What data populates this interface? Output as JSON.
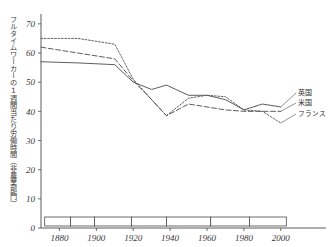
{
  "chart_data": {
    "type": "line",
    "title": "",
    "xlabel": "",
    "ylabel": "フルタイムワーカーの1週間当たり労働時間（非農業部門）",
    "xlim": [
      1870,
      2005
    ],
    "ylim": [
      0,
      72
    ],
    "grid": false,
    "legend_position": "right-inline",
    "xticks": [
      1880,
      1900,
      1920,
      1940,
      1960,
      1980,
      2000
    ],
    "xtick_labels": [
      "1880",
      "1900",
      "1920",
      "1940",
      "1960",
      "1980",
      "2000"
    ],
    "yticks": [
      0,
      10,
      20,
      30,
      40,
      50,
      60,
      70
    ],
    "ytick_labels": [
      "0",
      "10",
      "20",
      "30",
      "40",
      "50",
      "60",
      "70"
    ],
    "series": [
      {
        "name": "英国",
        "style": "solid",
        "x": [
          1870,
          1890,
          1910,
          1920,
          1930,
          1938,
          1950,
          1960,
          1970,
          1980,
          1990,
          2000
        ],
        "values": [
          57,
          56.6,
          56,
          50,
          47.5,
          49,
          45.5,
          45.5,
          44,
          40.5,
          42.5,
          41.5
        ]
      },
      {
        "name": "米国",
        "style": "dashed",
        "x": [
          1870,
          1890,
          1910,
          1920,
          1930,
          1938,
          1950,
          1960,
          1970,
          1980,
          1990,
          2000
        ],
        "values": [
          62,
          60,
          58,
          50.5,
          44,
          38.5,
          42.5,
          41.5,
          40.5,
          40,
          40,
          40
        ]
      },
      {
        "name": "フランス",
        "style": "dotted",
        "x": [
          1870,
          1890,
          1910,
          1920,
          1930,
          1938,
          1950,
          1960,
          1970,
          1980,
          1990,
          2000
        ],
        "values": [
          65,
          65,
          63,
          51,
          44,
          38.5,
          44.5,
          45.5,
          45,
          40.5,
          40,
          36
        ]
      }
    ],
    "bottom_bands": [
      {
        "start": 1872,
        "end": 1886,
        "filled": true
      },
      {
        "start": 1886,
        "end": 1899,
        "filled": false
      },
      {
        "start": 1899,
        "end": 1919,
        "filled": true
      },
      {
        "start": 1919,
        "end": 1938,
        "filled": false
      },
      {
        "start": 1938,
        "end": 1962,
        "filled": true
      },
      {
        "start": 1962,
        "end": 1983,
        "filled": false
      },
      {
        "start": 1983,
        "end": 2003,
        "filled": true
      }
    ]
  },
  "legend": {
    "uk_label": "英国",
    "us_label": "米国",
    "fr_label": "フランス"
  }
}
